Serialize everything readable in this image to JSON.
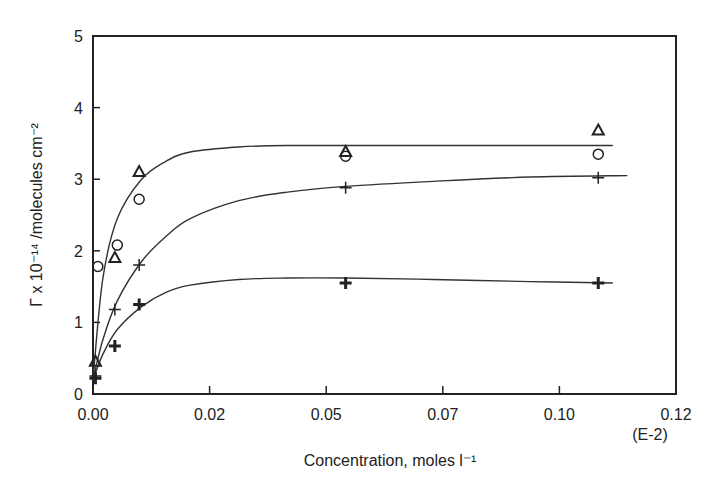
{
  "chart_data": {
    "type": "scatter",
    "title": "",
    "xlabel": "Concentration, moles l⁻¹",
    "ylabel": "Γ x 10⁻¹⁴ /molecules cm⁻²",
    "x_multiplier_label": "(E-2)",
    "xlim": [
      0.0,
      0.12
    ],
    "ylim": [
      0,
      5
    ],
    "x_ticks": [
      0.0,
      0.024,
      0.048,
      0.072,
      0.096,
      0.12
    ],
    "x_tick_labels": [
      "0.00",
      "0.02",
      "0.05",
      "0.07",
      "0.10",
      "0.12"
    ],
    "y_ticks": [
      0,
      1,
      2,
      3,
      4,
      5
    ],
    "y_tick_labels": [
      "0",
      "1",
      "2",
      "3",
      "4",
      "5"
    ],
    "grid": false,
    "legend": null,
    "series": [
      {
        "name": "triangle",
        "marker": "triangle",
        "x": [
          0.0005,
          0.0045,
          0.0095,
          0.052,
          0.104
        ],
        "y": [
          0.45,
          1.9,
          3.1,
          3.38,
          3.68
        ]
      },
      {
        "name": "circle",
        "marker": "circle",
        "x": [
          0.001,
          0.005,
          0.0095,
          0.052,
          0.104
        ],
        "y": [
          1.78,
          2.08,
          2.72,
          3.32,
          3.35
        ]
      },
      {
        "name": "thin-plus",
        "marker": "plus",
        "x": [
          0.0005,
          0.0045,
          0.0095,
          0.052,
          0.104
        ],
        "y": [
          0.25,
          1.18,
          1.8,
          2.88,
          3.02
        ]
      },
      {
        "name": "bold-plus",
        "marker": "bold-plus",
        "x": [
          0.0005,
          0.0045,
          0.0095,
          0.052,
          0.104
        ],
        "y": [
          0.22,
          0.67,
          1.25,
          1.55,
          1.55
        ]
      }
    ],
    "fit_curves": [
      {
        "name": "upper-fit",
        "x": [
          0.0,
          0.002,
          0.005,
          0.01,
          0.015,
          0.02,
          0.03,
          0.04,
          0.06,
          0.08,
          0.1,
          0.107
        ],
        "y": [
          0.2,
          1.6,
          2.45,
          3.0,
          3.25,
          3.38,
          3.45,
          3.47,
          3.47,
          3.47,
          3.47,
          3.47
        ]
      },
      {
        "name": "middle-fit",
        "x": [
          0.0,
          0.002,
          0.005,
          0.01,
          0.015,
          0.02,
          0.03,
          0.04,
          0.052,
          0.07,
          0.09,
          0.11
        ],
        "y": [
          0.2,
          0.75,
          1.3,
          1.85,
          2.2,
          2.45,
          2.7,
          2.82,
          2.9,
          2.97,
          3.03,
          3.05
        ]
      },
      {
        "name": "lower-fit",
        "x": [
          0.0,
          0.002,
          0.005,
          0.01,
          0.015,
          0.02,
          0.03,
          0.04,
          0.052,
          0.07,
          0.09,
          0.107
        ],
        "y": [
          0.2,
          0.55,
          0.9,
          1.22,
          1.42,
          1.52,
          1.6,
          1.62,
          1.62,
          1.6,
          1.57,
          1.55
        ]
      }
    ]
  }
}
